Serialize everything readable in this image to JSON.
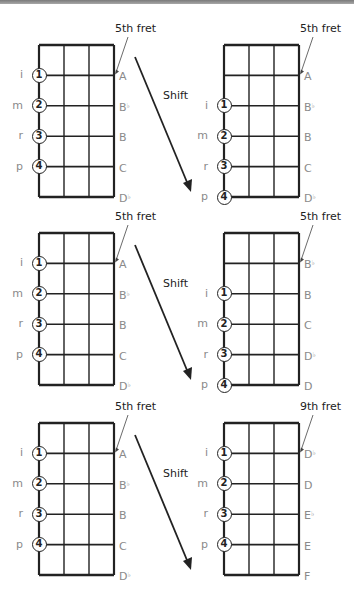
{
  "shift_label": "Shift",
  "panels": [
    {
      "left": {
        "fret_label": "5th fret",
        "fingers": [
          {
            "letter": "i",
            "num": "1",
            "row": 1
          },
          {
            "letter": "m",
            "num": "2",
            "row": 2
          },
          {
            "letter": "r",
            "num": "3",
            "row": 3
          },
          {
            "letter": "p",
            "num": "4",
            "row": 4
          }
        ],
        "notes": [
          {
            "name": "A",
            "acc": ""
          },
          {
            "name": "B",
            "acc": "♭"
          },
          {
            "name": "B",
            "acc": ""
          },
          {
            "name": "C",
            "acc": ""
          },
          {
            "name": "D",
            "acc": "♭"
          }
        ]
      },
      "right": {
        "fret_label": "5th fret",
        "fingers": [
          {
            "letter": "i",
            "num": "1",
            "row": 2
          },
          {
            "letter": "m",
            "num": "2",
            "row": 3
          },
          {
            "letter": "r",
            "num": "3",
            "row": 4
          },
          {
            "letter": "p",
            "num": "4",
            "row": 5
          }
        ],
        "notes": [
          {
            "name": "A",
            "acc": ""
          },
          {
            "name": "B",
            "acc": "♭"
          },
          {
            "name": "B",
            "acc": ""
          },
          {
            "name": "C",
            "acc": ""
          },
          {
            "name": "D",
            "acc": "♭"
          }
        ]
      }
    },
    {
      "left": {
        "fret_label": "5th fret",
        "fingers": [
          {
            "letter": "i",
            "num": "1",
            "row": 1
          },
          {
            "letter": "m",
            "num": "2",
            "row": 2
          },
          {
            "letter": "r",
            "num": "3",
            "row": 3
          },
          {
            "letter": "p",
            "num": "4",
            "row": 4
          }
        ],
        "notes": [
          {
            "name": "A",
            "acc": ""
          },
          {
            "name": "B",
            "acc": "♭"
          },
          {
            "name": "B",
            "acc": ""
          },
          {
            "name": "C",
            "acc": ""
          },
          {
            "name": "D",
            "acc": "♭"
          }
        ]
      },
      "right": {
        "fret_label": "5th fret",
        "fingers": [
          {
            "letter": "i",
            "num": "1",
            "row": 2
          },
          {
            "letter": "m",
            "num": "2",
            "row": 3
          },
          {
            "letter": "r",
            "num": "3",
            "row": 4
          },
          {
            "letter": "p",
            "num": "4",
            "row": 5
          }
        ],
        "notes": [
          {
            "name": "B",
            "acc": "♭"
          },
          {
            "name": "B",
            "acc": ""
          },
          {
            "name": "C",
            "acc": ""
          },
          {
            "name": "D",
            "acc": "♭"
          },
          {
            "name": "D",
            "acc": ""
          }
        ]
      }
    },
    {
      "left": {
        "fret_label": "5th fret",
        "fingers": [
          {
            "letter": "i",
            "num": "1",
            "row": 1
          },
          {
            "letter": "m",
            "num": "2",
            "row": 2
          },
          {
            "letter": "r",
            "num": "3",
            "row": 3
          },
          {
            "letter": "p",
            "num": "4",
            "row": 4
          }
        ],
        "notes": [
          {
            "name": "A",
            "acc": ""
          },
          {
            "name": "B",
            "acc": "♭"
          },
          {
            "name": "B",
            "acc": ""
          },
          {
            "name": "C",
            "acc": ""
          },
          {
            "name": "D",
            "acc": "♭"
          }
        ]
      },
      "right": {
        "fret_label": "9th fret",
        "fingers": [
          {
            "letter": "i",
            "num": "1",
            "row": 1
          },
          {
            "letter": "m",
            "num": "2",
            "row": 2
          },
          {
            "letter": "r",
            "num": "3",
            "row": 3
          },
          {
            "letter": "p",
            "num": "4",
            "row": 4
          }
        ],
        "notes": [
          {
            "name": "D",
            "acc": "♭"
          },
          {
            "name": "D",
            "acc": ""
          },
          {
            "name": "E",
            "acc": "♭"
          },
          {
            "name": "E",
            "acc": ""
          },
          {
            "name": "F",
            "acc": ""
          }
        ]
      }
    }
  ]
}
